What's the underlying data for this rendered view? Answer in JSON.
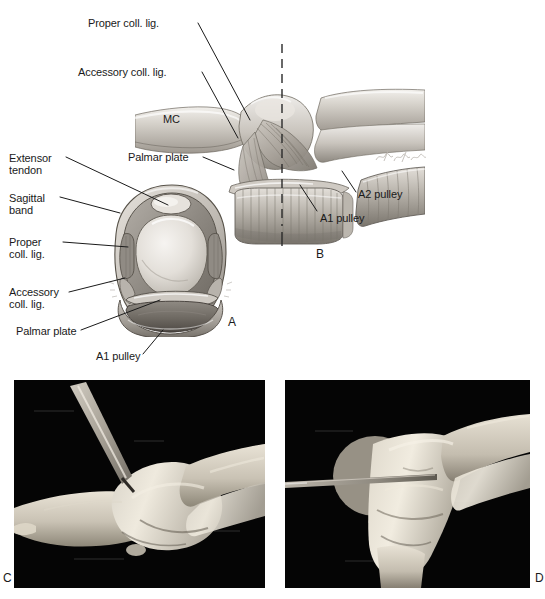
{
  "figure": {
    "type": "anatomical-illustration",
    "panels": [
      {
        "id": "A",
        "letter": "A",
        "kind": "illustration",
        "view": "cross-section"
      },
      {
        "id": "B",
        "letter": "B",
        "kind": "illustration",
        "view": "lateral"
      },
      {
        "id": "C",
        "letter": "C",
        "kind": "photograph",
        "view": "cadaver-dissection"
      },
      {
        "id": "D",
        "letter": "D",
        "kind": "photograph",
        "view": "cadaver-dissection"
      }
    ]
  },
  "labels": {
    "panel_b": [
      {
        "name": "proper-coll-lig",
        "text": "Proper coll. lig."
      },
      {
        "name": "accessory-coll-lig",
        "text": "Accessory coll. lig."
      },
      {
        "name": "mc-bone",
        "text": "MC"
      },
      {
        "name": "palmar-plate",
        "text": "Palmar plate"
      },
      {
        "name": "a1-pulley",
        "text": "A1 pulley"
      },
      {
        "name": "a2-pulley",
        "text": "A2 pulley"
      }
    ],
    "panel_a": [
      {
        "name": "extensor-tendon-line1",
        "text": "Extensor"
      },
      {
        "name": "extensor-tendon-line2",
        "text": "tendon"
      },
      {
        "name": "sagittal-band-line1",
        "text": "Sagittal"
      },
      {
        "name": "sagittal-band-line2",
        "text": "band"
      },
      {
        "name": "proper-coll-lig-line1",
        "text": "Proper"
      },
      {
        "name": "proper-coll-lig-line2",
        "text": "coll. lig."
      },
      {
        "name": "accessory-coll-lig-line1",
        "text": "Accessory"
      },
      {
        "name": "accessory-coll-lig-line2",
        "text": "coll. lig."
      },
      {
        "name": "palmar-plate",
        "text": "Palmar plate"
      },
      {
        "name": "a1-pulley",
        "text": "A1 pulley"
      },
      {
        "name": "mc-bone",
        "text": "MC"
      }
    ]
  },
  "panel_letters": {
    "a": "A",
    "b": "B",
    "c": "C",
    "d": "D"
  },
  "colors": {
    "ink": "#1a1a1a",
    "paper": "#ffffff",
    "photo_background": "#050505",
    "tissue_light": "#d8d4cd",
    "tissue_mid": "#a9a49c",
    "tissue_dark": "#6f6a63"
  },
  "signature": {
    "name": "artist-signature",
    "text": ""
  }
}
